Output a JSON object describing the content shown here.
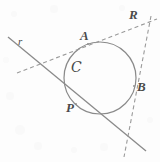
{
  "figure": {
    "type": "geometry-diagram",
    "background_color": "#fdfdfd",
    "stroke_color": "#7a7a7a",
    "label_color": "#4a4a4a",
    "labels": {
      "point_a": "A",
      "point_r": "R",
      "point_b": "B",
      "point_p": "P",
      "line_r": "r",
      "circle_c": "C"
    },
    "geometry": {
      "circle": {
        "cx": 100,
        "cy": 78,
        "r": 36
      },
      "tangent_point_a": {
        "x": 88,
        "y": 44
      },
      "tangent_point_b": {
        "x": 133,
        "y": 85
      },
      "tangent_point_p": {
        "x": 76,
        "y": 104
      },
      "external_point_r": {
        "x": 148,
        "y": 24
      },
      "secant_line_r": {
        "x1": 8,
        "y1": 37,
        "x2": 146,
        "y2": 151
      },
      "dashed_line_ar": {
        "x1": 17,
        "y1": 73,
        "x2": 156,
        "y2": 19
      },
      "dashed_line_rb": {
        "x1": 150,
        "y1": 17,
        "x2": 124,
        "y2": 156
      }
    }
  }
}
